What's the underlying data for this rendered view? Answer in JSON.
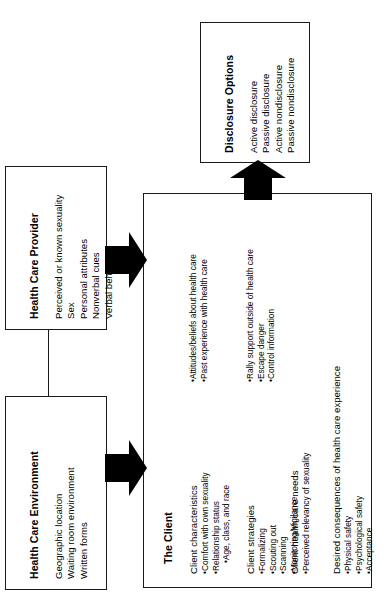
{
  "diagram": {
    "orientation": "rotated-90-ccw",
    "nodes": {
      "health_care_environment": {
        "title": "Health Care Environment",
        "items": [
          "Geographic location",
          "Waiting room environment",
          "Written forms"
        ]
      },
      "health_care_provider": {
        "title": "Health Care Provider",
        "items": [
          "Perceived or known sexuality",
          "Sex",
          "Personal attributes",
          "Nonverbal cues",
          "Verbal behaviors"
        ]
      },
      "the_client": {
        "title": "The Client",
        "groups": [
          {
            "heading": "Client characteristics",
            "bullets": [
              "Comfort with own sexuality",
              "Relationship status",
              "Age, class, and race"
            ]
          },
          {
            "heading": "",
            "bullets": [
              "Attitudes/beliefs about health care",
              "Past experience with health care"
            ]
          },
          {
            "heading": "Client strategies",
            "bullets": [
              "Formalizing",
              "Scouting out",
              "Scanning",
              "Monitoring/Vigilance"
            ]
          },
          {
            "heading": "",
            "bullets": [
              "Rally support outside of health care",
              "Escape danger",
              "Control information"
            ]
          },
          {
            "heading": "Client health care needs",
            "bullets": [
              "Perceived relevancy of sexuality"
            ]
          },
          {
            "heading": "Desired consequences of health care experience",
            "bullets": [
              "Physical safety",
              "Psychological safety",
              "Acceptance"
            ]
          }
        ]
      },
      "disclosure_options": {
        "title": "Disclosure Options",
        "items": [
          "Active disclosure",
          "Passive disclosure",
          "Active nondisclosure",
          "Passive nondisclosure"
        ]
      }
    },
    "connectors": [
      {
        "name": "provider-to-client",
        "type": "block-arrow"
      },
      {
        "name": "environment-to-client",
        "type": "block-arrow"
      },
      {
        "name": "client-to-disclosure",
        "type": "block-arrow"
      },
      {
        "name": "environment-provider-link",
        "type": "line"
      }
    ],
    "colors": {
      "stroke": "#1a1a1a",
      "fill": "#ffffff",
      "arrow": "#000000"
    }
  }
}
